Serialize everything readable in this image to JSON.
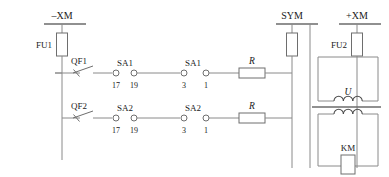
{
  "diagram": {
    "type": "electrical-schematic",
    "colors": {
      "wire": "#8a8a8a",
      "component_outline": "#6e6e6e",
      "text": "#1a1a1a",
      "background": "#ffffff"
    },
    "rails": [
      {
        "id": "rail-neg-xm",
        "label": "–XM",
        "x": 62,
        "header_y": 24
      },
      {
        "id": "rail-sym",
        "label": "SYM",
        "x": 292,
        "header_y": 24
      },
      {
        "id": "rail-pos-xm",
        "label": "+XM",
        "x": 357,
        "header_y": 24
      }
    ],
    "fuses": [
      {
        "id": "fuse-fu1",
        "label": "FU1",
        "rail": "–XM"
      },
      {
        "id": "fuse-fu2",
        "label": "FU2",
        "rail": "+XM"
      },
      {
        "id": "fuse-sym",
        "label": "",
        "rail": "SYM"
      }
    ],
    "branches": [
      {
        "id": "branch-1",
        "breaker": "QF1",
        "contacts": [
          {
            "label": "SA1",
            "terminals": [
              "17",
              "19"
            ]
          },
          {
            "label": "SA1",
            "terminals": [
              "3",
              "1"
            ]
          }
        ],
        "resistor": "R",
        "load": {
          "label": "U",
          "type": "coil"
        }
      },
      {
        "id": "branch-2",
        "breaker": "QF2",
        "contacts": [
          {
            "label": "SA2",
            "terminals": [
              "17",
              "19"
            ]
          },
          {
            "label": "SA2",
            "terminals": [
              "3",
              "1"
            ]
          }
        ],
        "resistor": "R",
        "load": {
          "label": "KM",
          "type": "contactor-coil"
        }
      }
    ],
    "labels": {
      "rail_neg": "–XM",
      "rail_sym": "SYM",
      "rail_pos": "+XM",
      "fu1": "FU1",
      "fu2": "FU2",
      "qf1": "QF1",
      "qf2": "QF2",
      "sa1_a": "SA1",
      "sa1_b": "SA1",
      "sa2_a": "SA2",
      "sa2_b": "SA2",
      "n17_a": "17",
      "n19_a": "19",
      "n3_a": "3",
      "n1_a": "1",
      "n17_b": "17",
      "n19_b": "19",
      "n3_b": "3",
      "n1_b": "1",
      "r1": "R",
      "r2": "R",
      "u_coil": "U",
      "km_coil": "KM"
    }
  }
}
